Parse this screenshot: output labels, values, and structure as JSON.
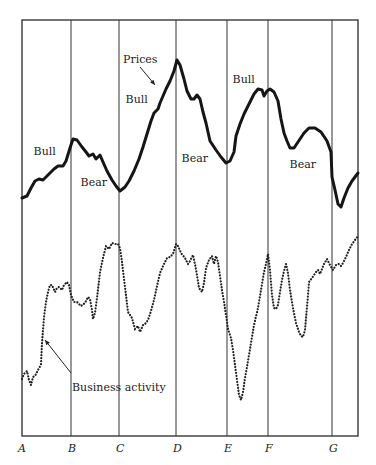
{
  "chart_data": {
    "type": "line",
    "title": "",
    "xlabel": "",
    "ylabel": "",
    "grid": "vertical lines at turning points",
    "x_ticks": [
      "A",
      "B",
      "C",
      "D",
      "E",
      "F",
      "G"
    ],
    "x_tick_positions_px": [
      22,
      71,
      119,
      176,
      227,
      268,
      332
    ],
    "series": [
      {
        "name": "Prices",
        "style": "solid-thick",
        "points_px": [
          [
            22,
            198
          ],
          [
            27,
            196
          ],
          [
            31,
            188
          ],
          [
            35,
            181
          ],
          [
            39,
            179
          ],
          [
            43,
            180
          ],
          [
            48,
            175
          ],
          [
            54,
            169
          ],
          [
            58,
            166
          ],
          [
            63,
            166
          ],
          [
            66,
            161
          ],
          [
            70,
            148
          ],
          [
            73,
            139
          ],
          [
            77,
            140
          ],
          [
            82,
            147
          ],
          [
            86,
            152
          ],
          [
            89,
            156
          ],
          [
            93,
            154
          ],
          [
            96,
            159
          ],
          [
            100,
            155
          ],
          [
            103,
            162
          ],
          [
            107,
            171
          ],
          [
            112,
            180
          ],
          [
            116,
            186
          ],
          [
            120,
            191
          ],
          [
            125,
            187
          ],
          [
            129,
            181
          ],
          [
            134,
            171
          ],
          [
            139,
            159
          ],
          [
            143,
            147
          ],
          [
            147,
            134
          ],
          [
            151,
            121
          ],
          [
            154,
            113
          ],
          [
            158,
            109
          ],
          [
            160,
            103
          ],
          [
            163,
            96
          ],
          [
            166,
            89
          ],
          [
            170,
            81
          ],
          [
            174,
            71
          ],
          [
            177,
            60
          ],
          [
            180,
            65
          ],
          [
            184,
            79
          ],
          [
            187,
            91
          ],
          [
            191,
            99
          ],
          [
            194,
            99
          ],
          [
            197,
            95
          ],
          [
            200,
            99
          ],
          [
            203,
            112
          ],
          [
            206,
            123
          ],
          [
            210,
            141
          ],
          [
            216,
            150
          ],
          [
            221,
            157
          ],
          [
            226,
            163
          ],
          [
            230,
            161
          ],
          [
            234,
            152
          ],
          [
            236,
            136
          ],
          [
            240,
            124
          ],
          [
            244,
            114
          ],
          [
            249,
            104
          ],
          [
            254,
            94
          ],
          [
            258,
            89
          ],
          [
            262,
            90
          ],
          [
            264,
            96
          ],
          [
            267,
            91
          ],
          [
            270,
            89
          ],
          [
            274,
            92
          ],
          [
            278,
            101
          ],
          [
            281,
            119
          ],
          [
            284,
            133
          ],
          [
            287,
            141
          ],
          [
            290,
            148
          ],
          [
            294,
            148
          ],
          [
            298,
            142
          ],
          [
            304,
            133
          ],
          [
            309,
            128
          ],
          [
            315,
            128
          ],
          [
            321,
            132
          ],
          [
            327,
            141
          ],
          [
            331,
            152
          ],
          [
            332,
            177
          ],
          [
            335,
            190
          ],
          [
            338,
            204
          ],
          [
            341,
            207
          ],
          [
            344,
            198
          ],
          [
            348,
            188
          ],
          [
            352,
            181
          ],
          [
            358,
            173
          ]
        ]
      },
      {
        "name": "Business activity",
        "style": "dotted",
        "points_px": [
          [
            22,
            379
          ],
          [
            24,
            374
          ],
          [
            27,
            371
          ],
          [
            29,
            380
          ],
          [
            31,
            385
          ],
          [
            33,
            377
          ],
          [
            35,
            376
          ],
          [
            37,
            372
          ],
          [
            39,
            368
          ],
          [
            41,
            365
          ],
          [
            42,
            343
          ],
          [
            44,
            317
          ],
          [
            46,
            302
          ],
          [
            48,
            292
          ],
          [
            50,
            285
          ],
          [
            52,
            285
          ],
          [
            55,
            292
          ],
          [
            57,
            288
          ],
          [
            59,
            287
          ],
          [
            62,
            290
          ],
          [
            64,
            285
          ],
          [
            67,
            282
          ],
          [
            69,
            285
          ],
          [
            71,
            295
          ],
          [
            74,
            302
          ],
          [
            77,
            302
          ],
          [
            81,
            306
          ],
          [
            85,
            303
          ],
          [
            88,
            297
          ],
          [
            90,
            299
          ],
          [
            92,
            310
          ],
          [
            93,
            319
          ],
          [
            95,
            313
          ],
          [
            97,
            298
          ],
          [
            100,
            272
          ],
          [
            103,
            258
          ],
          [
            106,
            246
          ],
          [
            109,
            249
          ],
          [
            112,
            243
          ],
          [
            115,
            244
          ],
          [
            118,
            244
          ],
          [
            120,
            248
          ],
          [
            122,
            262
          ],
          [
            125,
            287
          ],
          [
            128,
            312
          ],
          [
            132,
            318
          ],
          [
            135,
            329
          ],
          [
            138,
            326
          ],
          [
            140,
            332
          ],
          [
            143,
            325
          ],
          [
            145,
            324
          ],
          [
            148,
            320
          ],
          [
            151,
            311
          ],
          [
            154,
            300
          ],
          [
            157,
            286
          ],
          [
            160,
            273
          ],
          [
            164,
            264
          ],
          [
            167,
            258
          ],
          [
            170,
            257
          ],
          [
            173,
            254
          ],
          [
            176,
            244
          ],
          [
            178,
            246
          ],
          [
            181,
            253
          ],
          [
            185,
            258
          ],
          [
            188,
            264
          ],
          [
            190,
            261
          ],
          [
            193,
            255
          ],
          [
            195,
            264
          ],
          [
            197,
            275
          ],
          [
            199,
            288
          ],
          [
            202,
            292
          ],
          [
            204,
            283
          ],
          [
            206,
            268
          ],
          [
            209,
            260
          ],
          [
            212,
            256
          ],
          [
            214,
            264
          ],
          [
            216,
            256
          ],
          [
            218,
            262
          ],
          [
            220,
            276
          ],
          [
            222,
            290
          ],
          [
            224,
            302
          ],
          [
            226,
            315
          ],
          [
            228,
            329
          ],
          [
            231,
            338
          ],
          [
            233,
            350
          ],
          [
            235,
            365
          ],
          [
            237,
            380
          ],
          [
            239,
            395
          ],
          [
            241,
            400
          ],
          [
            243,
            392
          ],
          [
            245,
            378
          ],
          [
            248,
            361
          ],
          [
            251,
            343
          ],
          [
            254,
            325
          ],
          [
            258,
            308
          ],
          [
            261,
            290
          ],
          [
            264,
            272
          ],
          [
            266,
            264
          ],
          [
            268,
            254
          ],
          [
            270,
            270
          ],
          [
            272,
            295
          ],
          [
            274,
            308
          ],
          [
            276,
            309
          ],
          [
            278,
            305
          ],
          [
            280,
            292
          ],
          [
            282,
            280
          ],
          [
            284,
            271
          ],
          [
            286,
            264
          ],
          [
            288,
            273
          ],
          [
            290,
            290
          ],
          [
            293,
            308
          ],
          [
            296,
            323
          ],
          [
            299,
            332
          ],
          [
            301,
            336
          ],
          [
            303,
            337
          ],
          [
            305,
            330
          ],
          [
            306,
            318
          ],
          [
            308,
            295
          ],
          [
            309,
            282
          ],
          [
            312,
            278
          ],
          [
            314,
            275
          ],
          [
            316,
            272
          ],
          [
            318,
            270
          ],
          [
            320,
            274
          ],
          [
            322,
            269
          ],
          [
            324,
            264
          ],
          [
            327,
            259
          ],
          [
            330,
            265
          ],
          [
            333,
            270
          ],
          [
            336,
            265
          ],
          [
            339,
            264
          ],
          [
            341,
            266
          ],
          [
            343,
            263
          ],
          [
            346,
            257
          ],
          [
            349,
            250
          ],
          [
            352,
            244
          ],
          [
            355,
            240
          ],
          [
            358,
            236
          ]
        ]
      }
    ],
    "annotations": [
      {
        "text": "Bull",
        "x": 44,
        "y": 155
      },
      {
        "text": "Bear",
        "x": 91,
        "y": 186
      },
      {
        "text": "Prices",
        "x": 136,
        "y": 63,
        "arrow_to": [
          155,
          85
        ]
      },
      {
        "text": "Bull",
        "x": 136,
        "y": 103
      },
      {
        "text": "Bear",
        "x": 192,
        "y": 162
      },
      {
        "text": "Bull",
        "x": 243,
        "y": 83
      },
      {
        "text": "Bear",
        "x": 300,
        "y": 168
      },
      {
        "text": "Business activity",
        "x": 115,
        "y": 391,
        "arrow_from": [
          71,
          373
        ],
        "arrow_to": [
          45,
          340
        ]
      }
    ],
    "frame_px": {
      "left": 22,
      "top": 20,
      "right": 358,
      "bottom": 436
    }
  }
}
